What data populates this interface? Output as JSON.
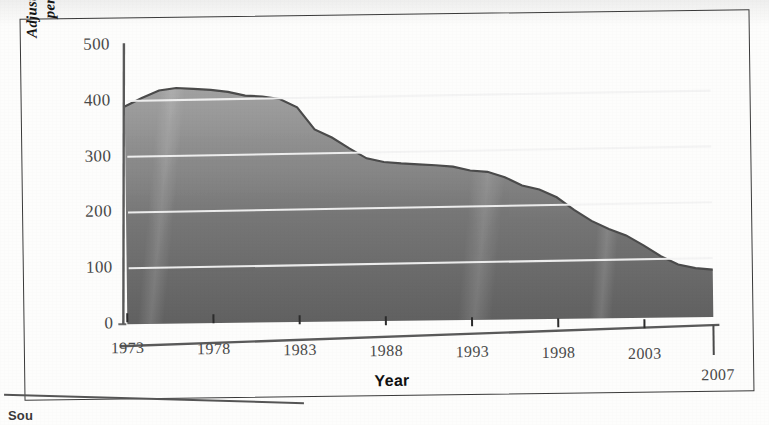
{
  "figure": {
    "title_faint": "",
    "source_text": "Sou",
    "xlabel": "Year",
    "ylabel": "Adjusted Victimization Rate\nper 1,000 Households"
  },
  "colors": {
    "area_top": "#9d9d9d",
    "area_bottom": "#5f5f5f",
    "area_edge": "#4f4f4f",
    "gridline": "#f2f2f2",
    "axis": "#4a4a4a",
    "frame": "#3a3a3a",
    "text": "#151515",
    "tick_text": "#4a4a4a",
    "page": "#fdfdfc"
  },
  "chart_data": {
    "type": "area",
    "title": "",
    "xlabel": "Year",
    "ylabel": "Adjusted Victimization Rate per 1,000 Households",
    "xlim": [
      1973,
      2007
    ],
    "ylim": [
      0,
      500
    ],
    "ytick_values": [
      0,
      100,
      200,
      300,
      400,
      500
    ],
    "ytick_labels": [
      "0",
      "100",
      "200",
      "300",
      "400",
      "500"
    ],
    "xtick_values": [
      1973,
      1978,
      1983,
      1988,
      1993,
      1998,
      2003,
      2007
    ],
    "xtick_labels": [
      "1973",
      "1978",
      "1983",
      "1988",
      "1993",
      "1998",
      "2003",
      "2007"
    ],
    "grid": "horizontal",
    "legend": "none",
    "x": [
      1973,
      1974,
      1975,
      1976,
      1977,
      1978,
      1979,
      1980,
      1981,
      1982,
      1983,
      1984,
      1985,
      1986,
      1987,
      1988,
      1989,
      1990,
      1991,
      1992,
      1993,
      1994,
      1995,
      1996,
      1997,
      1998,
      1999,
      2000,
      2001,
      2002,
      2003,
      2004,
      2005,
      2006,
      2007
    ],
    "values": [
      390,
      405,
      418,
      422,
      420,
      418,
      414,
      407,
      405,
      400,
      385,
      345,
      330,
      310,
      292,
      285,
      282,
      280,
      278,
      275,
      268,
      265,
      255,
      240,
      232,
      218,
      195,
      175,
      160,
      148,
      130,
      110,
      95,
      88,
      85
    ],
    "series": [
      {
        "name": "Adjusted household property victimization rate",
        "values": [
          390,
          405,
          418,
          422,
          420,
          418,
          414,
          407,
          405,
          400,
          385,
          345,
          330,
          310,
          292,
          285,
          282,
          280,
          278,
          275,
          268,
          265,
          255,
          240,
          232,
          218,
          195,
          175,
          160,
          148,
          130,
          110,
          95,
          88,
          85
        ]
      }
    ],
    "peak": {
      "year": 1976,
      "value": 422
    },
    "end": {
      "year": 2007,
      "value": 85
    }
  }
}
